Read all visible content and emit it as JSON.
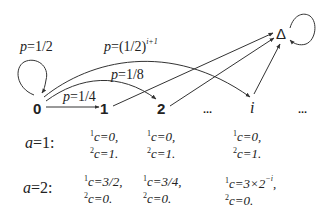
{
  "diagram": {
    "nodes": {
      "n0": "0",
      "n1": "1",
      "n2": "2",
      "dots1": "...",
      "ni": "i",
      "dots2": "...",
      "absorbing": "Δ"
    },
    "edge_labels": {
      "self_loop_0": {
        "prefix": "p",
        "eq": "=",
        "value": "1/2"
      },
      "edge_0_to_i": {
        "prefix": "p",
        "eq": "=",
        "value": "(1/2)",
        "exponent": "i+1"
      },
      "edge_0_to_2": {
        "prefix": "p",
        "eq": "=",
        "value": "1/8"
      },
      "edge_0_to_1": {
        "prefix": "p",
        "eq": "=",
        "value": "1/4"
      }
    },
    "edges": [
      {
        "from": "0",
        "to": "0",
        "label": "p=1/2",
        "type": "self-loop"
      },
      {
        "from": "0",
        "to": "1",
        "label": "p=1/4",
        "type": "straight"
      },
      {
        "from": "0",
        "to": "2",
        "label": "p=1/8",
        "type": "curve"
      },
      {
        "from": "0",
        "to": "i",
        "label": "p=(1/2)^(i+1)",
        "type": "curve"
      },
      {
        "from": "1",
        "to": "Δ",
        "type": "straight"
      },
      {
        "from": "2",
        "to": "Δ",
        "type": "straight"
      },
      {
        "from": "i",
        "to": "Δ",
        "type": "straight"
      },
      {
        "from": "Δ",
        "to": "Δ",
        "type": "self-loop"
      }
    ]
  },
  "table": {
    "rows": [
      {
        "label": {
          "var": "a",
          "eq": "=1:"
        },
        "cells": [
          {
            "c1_sup": "1",
            "c1": "c=0,",
            "c2_sup": "2",
            "c2": "c=1."
          },
          {
            "c1_sup": "1",
            "c1": "c=0,",
            "c2_sup": "2",
            "c2": "c=1."
          },
          {
            "c1_sup": "1",
            "c1": "c=0,",
            "c2_sup": "2",
            "c2": "c=1."
          }
        ]
      },
      {
        "label": {
          "var": "a",
          "eq": "=2:"
        },
        "cells": [
          {
            "c1_sup": "1",
            "c1": "c=3/2,",
            "c2_sup": "2",
            "c2": "c=0."
          },
          {
            "c1_sup": "1",
            "c1": "c=3/4,",
            "c2_sup": "2",
            "c2": "c=0."
          },
          {
            "c1_sup": "1",
            "c1": "c=3×2",
            "c1_exp": "−i",
            "c1_tail": ",",
            "c2_sup": "2",
            "c2": "c=0."
          }
        ]
      }
    ]
  }
}
